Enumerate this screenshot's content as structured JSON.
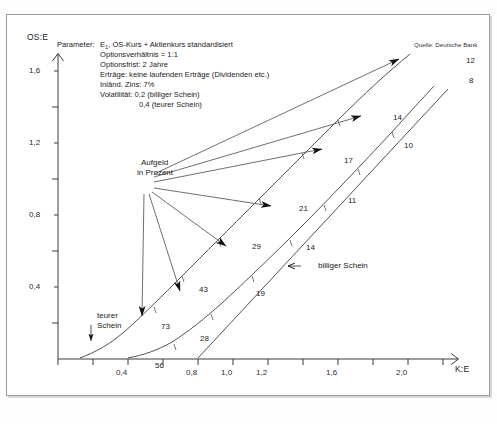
{
  "chart_data": {
    "type": "line",
    "title": "",
    "xlabel": "K:E",
    "ylabel": "OS:E",
    "xlim": [
      0.18,
      2.46
    ],
    "ylim": [
      0.0,
      1.86
    ],
    "xticks": [
      0.2,
      0.4,
      0.6,
      0.8,
      1.0,
      1.2,
      1.4,
      1.6,
      1.8,
      2.0,
      2.2,
      2.4
    ],
    "xtick_labels": [
      "",
      "0,4",
      "",
      "0,8",
      "1,0",
      "1,2",
      "",
      "1,6",
      "",
      "2,0",
      "",
      ""
    ],
    "yticks": [
      0.2,
      0.4,
      0.6,
      0.8,
      1.0,
      1.2,
      1.4,
      1.6,
      1.8
    ],
    "ytick_labels": [
      "",
      "0,4",
      "",
      "0,8",
      "",
      "1,2",
      "",
      "1,6",
      ""
    ],
    "grid": false,
    "legend_position": "inline-annotations",
    "series": [
      {
        "name": "teurer Schein",
        "note": "Volatilitat 0,4 — upper curve",
        "x": [
          0.26,
          0.35,
          0.45,
          0.55,
          0.65,
          0.75,
          0.85,
          0.95,
          1.05,
          1.2,
          1.4,
          1.6,
          1.8,
          2.0,
          2.2,
          2.4
        ],
        "y": [
          0.005,
          0.03,
          0.068,
          0.115,
          0.17,
          0.232,
          0.3,
          0.372,
          0.448,
          0.566,
          0.73,
          0.898,
          1.068,
          1.24,
          1.414,
          1.588
        ]
      },
      {
        "name": "billiger Schein",
        "note": "Volatilitat 0,2 — middle curve",
        "x": [
          0.45,
          0.55,
          0.65,
          0.75,
          0.85,
          0.95,
          1.05,
          1.2,
          1.4,
          1.6,
          1.8,
          2.0,
          2.2,
          2.4
        ],
        "y": [
          0.004,
          0.022,
          0.052,
          0.092,
          0.14,
          0.196,
          0.258,
          0.36,
          0.508,
          0.664,
          0.824,
          0.986,
          1.15,
          1.315
        ]
      },
      {
        "name": "innerer Wert",
        "note": "straight line, starts at K:E = 1,0",
        "x": [
          1.0,
          2.45
        ],
        "y": [
          0.0,
          1.36
        ]
      }
    ],
    "point_labels": [
      {
        "text": "12",
        "x": 2.4,
        "y": 1.6,
        "series": "teurer Schein"
      },
      {
        "text": "8",
        "x": 2.42,
        "y": 1.44,
        "series": "billiger Schein"
      },
      {
        "text": "14",
        "x": 1.8,
        "y": 1.09,
        "series": "teurer Schein"
      },
      {
        "text": "10",
        "x": 1.98,
        "y": 0.99,
        "series": "billiger Schein"
      },
      {
        "text": "17",
        "x": 1.62,
        "y": 0.9,
        "series": "teurer Schein"
      },
      {
        "text": "11",
        "x": 1.75,
        "y": 0.77,
        "series": "billiger Schein"
      },
      {
        "text": "21",
        "x": 1.32,
        "y": 0.71,
        "series": "teurer Schein"
      },
      {
        "text": "14",
        "x": 1.52,
        "y": 0.61,
        "series": "billiger Schein"
      },
      {
        "text": "29",
        "x": 1.06,
        "y": 0.54,
        "series": "teurer Schein"
      },
      {
        "text": "19",
        "x": 1.26,
        "y": 0.44,
        "series": "billiger Schein"
      },
      {
        "text": "43",
        "x": 0.83,
        "y": 0.36,
        "series": "teurer Schein"
      },
      {
        "text": "73",
        "x": 0.68,
        "y": 0.18,
        "series": "teurer Schein"
      },
      {
        "text": "28",
        "x": 0.9,
        "y": 0.14,
        "series": "billiger Schein"
      },
      {
        "text": "56",
        "x": 0.72,
        "y": 0.03,
        "series": "billiger Schein"
      }
    ],
    "annotations": [
      {
        "name": "aufgeld-callout",
        "text": "Aufgeld\nin Prozent"
      },
      {
        "name": "teurer-schein-callout",
        "text": "teurer\nSchein"
      },
      {
        "name": "billiger-schein-callout",
        "text": "billiger Schein"
      }
    ]
  },
  "axes": {
    "y_axis_label": "OS:E",
    "x_axis_label": "K:E",
    "y_tick_labels": [
      "1,6",
      "1,2",
      "0,8",
      "0,4"
    ],
    "x_tick_labels": [
      "0,4",
      "0,8",
      "1,0",
      "1,2",
      "1,6",
      "2,0"
    ]
  },
  "parameters": {
    "heading": "Parameter:",
    "lines": [
      "E₁, OS-Kurs + Aktienkurs standardisiert",
      "Optionsverhältnis = 1:1",
      "Optionsfrist: 2 Jahre",
      "Erträge: keine laufenden Erträge (Dividenden etc.)",
      "Inländ. Zins: 7%",
      "Volatilität: 0,2 (billiger Schein)",
      "0,4 (teurer Schein)"
    ],
    "line1_prefix": "E",
    "line1_sub": "1",
    "line1_rest": ", OS-Kurs + Aktienkurs standardisiert"
  },
  "source": {
    "text": "Quelle: Deutsche Bank"
  },
  "callouts": {
    "aufgeld_line1": "Aufgeld",
    "aufgeld_line2": "in Prozent",
    "teurer_line1": "teurer",
    "teurer_line2": "Schein",
    "billiger": "billiger Schein",
    "billiger_arrow": "←"
  },
  "curve_numbers": {
    "n12": "12",
    "n8": "8",
    "n14a": "14",
    "n10": "10",
    "n17": "17",
    "n11": "11",
    "n21": "21",
    "n14b": "14",
    "n29": "29",
    "n19": "19",
    "n43": "43",
    "n73": "73",
    "n28": "28",
    "n56": "56"
  },
  "caption": {
    "text": ""
  }
}
